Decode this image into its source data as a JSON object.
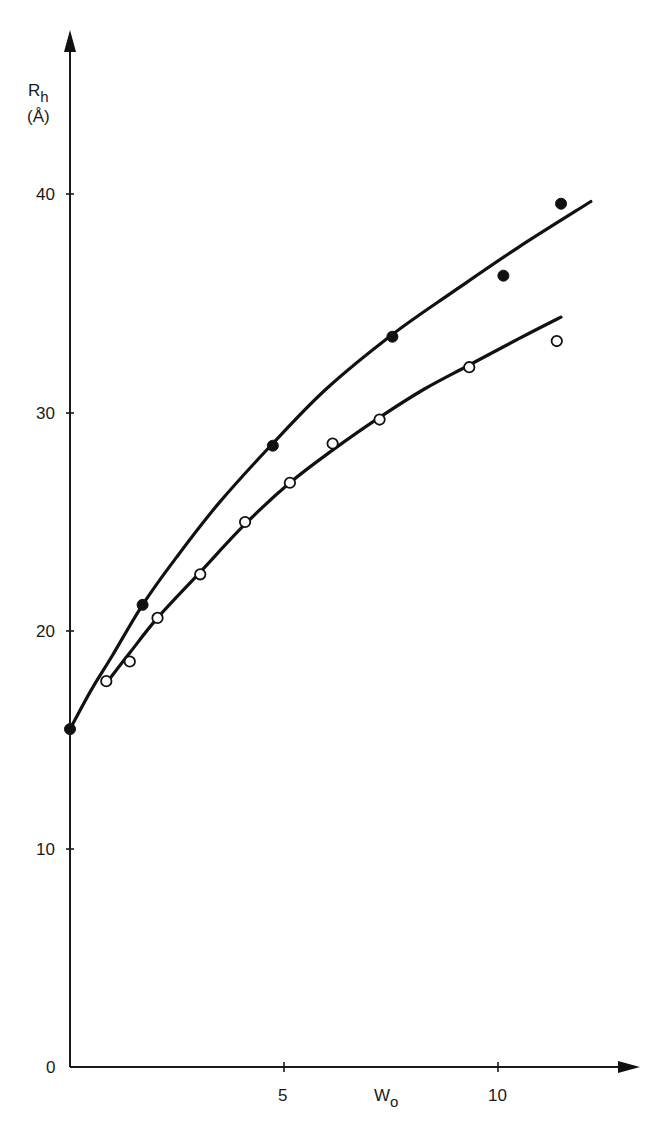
{
  "chart_data": {
    "type": "scatter",
    "title": "",
    "xlabel": "W",
    "xlabel_subscript": "o",
    "ylabel": "R",
    "ylabel_subscript": "h",
    "ylabel_unit": "(Å)",
    "xlim": [
      0,
      13
    ],
    "ylim": [
      0,
      45
    ],
    "x_ticks": [
      5,
      10
    ],
    "x_tick_labels": [
      "5",
      "10"
    ],
    "y_ticks": [
      0,
      10,
      20,
      30,
      40
    ],
    "y_tick_labels": [
      "0",
      "10",
      "20",
      "30",
      "40"
    ],
    "grid": false,
    "legend": null,
    "series": [
      {
        "name": "filled circles",
        "marker": "filled-circle",
        "points": [
          {
            "x": 0.0,
            "y": 15.5
          },
          {
            "x": 1.7,
            "y": 21.2
          },
          {
            "x": 4.75,
            "y": 28.5
          },
          {
            "x": 7.55,
            "y": 33.5
          },
          {
            "x": 10.15,
            "y": 36.3
          },
          {
            "x": 11.5,
            "y": 39.6
          }
        ],
        "fit_curve": [
          {
            "x": 0.0,
            "y": 15.5
          },
          {
            "x": 0.5,
            "y": 17.3
          },
          {
            "x": 1.0,
            "y": 18.9
          },
          {
            "x": 1.7,
            "y": 21.2
          },
          {
            "x": 2.5,
            "y": 23.4
          },
          {
            "x": 3.5,
            "y": 25.9
          },
          {
            "x": 4.75,
            "y": 28.6
          },
          {
            "x": 6.0,
            "y": 31.1
          },
          {
            "x": 7.55,
            "y": 33.6
          },
          {
            "x": 9.0,
            "y": 35.6
          },
          {
            "x": 10.5,
            "y": 37.6
          },
          {
            "x": 12.2,
            "y": 39.7
          }
        ]
      },
      {
        "name": "open circles",
        "marker": "open-circle",
        "points": [
          {
            "x": 0.85,
            "y": 17.7
          },
          {
            "x": 1.4,
            "y": 18.6
          },
          {
            "x": 2.05,
            "y": 20.6
          },
          {
            "x": 3.05,
            "y": 22.6
          },
          {
            "x": 4.1,
            "y": 25.0
          },
          {
            "x": 5.15,
            "y": 26.8
          },
          {
            "x": 6.15,
            "y": 28.6
          },
          {
            "x": 7.25,
            "y": 29.7
          },
          {
            "x": 9.35,
            "y": 32.1
          },
          {
            "x": 11.4,
            "y": 33.3
          }
        ],
        "fit_curve": [
          {
            "x": 0.85,
            "y": 17.6
          },
          {
            "x": 1.4,
            "y": 19.0
          },
          {
            "x": 2.05,
            "y": 20.6
          },
          {
            "x": 3.05,
            "y": 22.7
          },
          {
            "x": 4.1,
            "y": 24.9
          },
          {
            "x": 5.15,
            "y": 26.8
          },
          {
            "x": 6.15,
            "y": 28.3
          },
          {
            "x": 7.25,
            "y": 29.8
          },
          {
            "x": 8.3,
            "y": 31.1
          },
          {
            "x": 9.35,
            "y": 32.2
          },
          {
            "x": 10.5,
            "y": 33.4
          },
          {
            "x": 11.5,
            "y": 34.4
          }
        ]
      }
    ]
  },
  "labels": {
    "y_title_main": "R",
    "y_title_sub": "h",
    "y_title_unit": "(Å)",
    "x_title_main": "W",
    "x_title_sub": "o",
    "origin": "0",
    "y_10": "10",
    "y_20": "20",
    "y_30": "30",
    "y_40": "40",
    "x_5": "5",
    "x_10": "10"
  }
}
